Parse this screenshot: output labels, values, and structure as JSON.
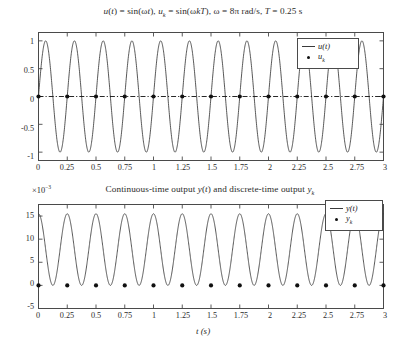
{
  "figure": {
    "width": 406,
    "height": 358,
    "background": "#ffffff",
    "line_color": "#3a3a3a",
    "marker_color": "#101010",
    "axis_color": "#4a4a4a"
  },
  "xlabel": "t (s)",
  "panels": [
    {
      "name": "input-signal-plot",
      "title_parts": {
        "full": "u(t) = sin(ωt), uₖ = sin(ωkT), ω = 8π rad/s, T = 0.25 s"
      },
      "axis_multiplier": "",
      "legend": [
        {
          "label": "u(t)",
          "symbol": "line"
        },
        {
          "label": "uₖ",
          "symbol": "dot"
        }
      ],
      "xticks": [
        "0",
        "0.25",
        "0.5",
        "0.75",
        "1",
        "1.25",
        "1.5",
        "1.75",
        "2",
        "2.25",
        "2.5",
        "2.75",
        "3"
      ],
      "yticks": [
        "1",
        "0.5",
        "0",
        "-0.5",
        "-1"
      ]
    },
    {
      "name": "output-signal-plot",
      "title_parts": {
        "full": "Continuous-time output y(t) and discrete-time output yₖ"
      },
      "axis_multiplier": "×10⁻³",
      "legend": [
        {
          "label": "y(t)",
          "symbol": "line"
        },
        {
          "label": "yₖ",
          "symbol": "dot"
        }
      ],
      "xticks": [
        "0",
        "0.25",
        "0.5",
        "0.75",
        "1",
        "1.25",
        "1.5",
        "1.75",
        "2",
        "2.25",
        "2.5",
        "2.75",
        "3"
      ],
      "yticks": [
        "15",
        "10",
        "5",
        "0",
        "-5"
      ]
    }
  ],
  "chart_data": [
    {
      "type": "line",
      "name": "input-signal",
      "title": "u(t) = sin(ωt), uₖ = sin(ωkT), ω = 8π rad/s, T = 0.25 s",
      "xlabel": "t (s)",
      "ylabel": "",
      "xlim": [
        0,
        3
      ],
      "ylim": [
        -1.15,
        1.15
      ],
      "xticks": [
        0,
        0.25,
        0.5,
        0.75,
        1,
        1.25,
        1.5,
        1.75,
        2,
        2.25,
        2.5,
        2.75,
        3
      ],
      "yticks": [
        1,
        0.5,
        0,
        -0.5,
        -1
      ],
      "grid": false,
      "legend_position": "upper-right",
      "series": [
        {
          "name": "u(t)",
          "style": "continuous-line",
          "formula": "sin(8*pi*t)",
          "amplitude": 1.0,
          "frequency_rad_per_s": 25.1327,
          "period_s": 0.25,
          "cycles_shown": 12
        },
        {
          "name": "u_k",
          "style": "markers-with-dashdot-line",
          "formula": "sin(8*pi*k*0.25)",
          "sample_period_s": 0.25,
          "x": [
            0,
            0.25,
            0.5,
            0.75,
            1,
            1.25,
            1.5,
            1.75,
            2,
            2.25,
            2.5,
            2.75,
            3
          ],
          "values": [
            0,
            0,
            0,
            0,
            0,
            0,
            0,
            0,
            0,
            0,
            0,
            0,
            0
          ]
        }
      ],
      "annotation": "Sampling at T = 0.25 s aliases sin(8πt) to all-zero samples"
    },
    {
      "type": "line",
      "name": "output-signal",
      "title": "Continuous-time output y(t) and discrete-time output yₖ",
      "xlabel": "t (s)",
      "ylabel": "",
      "y_axis_multiplier": 0.001,
      "y_axis_multiplier_label": "×10⁻³",
      "xlim": [
        0,
        3
      ],
      "ylim": [
        -5,
        17.5
      ],
      "xticks": [
        0,
        0.25,
        0.5,
        0.75,
        1,
        1.25,
        1.5,
        1.75,
        2,
        2.25,
        2.5,
        2.75,
        3
      ],
      "yticks": [
        15,
        10,
        5,
        0,
        -5
      ],
      "grid": false,
      "legend_position": "upper-right",
      "series": [
        {
          "name": "y(t)",
          "style": "continuous-line",
          "description": "rectified-like oscillation between 0 and ~15.5e-3, period 0.25 s",
          "min_value": 0.0,
          "max_value": 15.5,
          "period_s": 0.25,
          "cycles_shown": 12
        },
        {
          "name": "y_k",
          "style": "markers",
          "sample_period_s": 0.25,
          "x": [
            0,
            0.25,
            0.5,
            0.75,
            1,
            1.25,
            1.5,
            1.75,
            2,
            2.25,
            2.5,
            2.75,
            3
          ],
          "values": [
            0,
            0,
            0,
            0,
            0,
            0,
            0,
            0,
            0,
            0,
            0,
            0,
            0
          ]
        }
      ],
      "annotation": "Discrete samples y_k land on the minima of y(t)"
    }
  ]
}
